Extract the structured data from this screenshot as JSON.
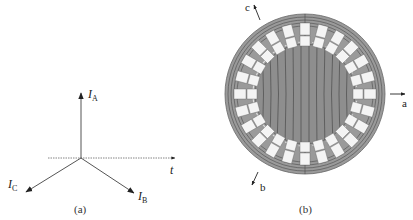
{
  "panel_a": {
    "caption": "(a)",
    "vectors": [
      {
        "name": "I",
        "sub": "A",
        "direction_deg": 90
      },
      {
        "name": "I",
        "sub": "B",
        "direction_deg": -30
      },
      {
        "name": "I",
        "sub": "C",
        "direction_deg": 210
      }
    ],
    "time_axis_label": "t"
  },
  "panel_b": {
    "caption": "(b)",
    "axes": [
      {
        "label": "a",
        "direction": "right"
      },
      {
        "label": "b",
        "direction": "down-left"
      },
      {
        "label": "c",
        "direction": "up-left"
      }
    ],
    "stator_slots": 24,
    "colors": {
      "iron": "#9a9a9a",
      "flux_lines": "#4a4a4a",
      "slots": "#f4f4f4",
      "outline": "#555555"
    }
  }
}
